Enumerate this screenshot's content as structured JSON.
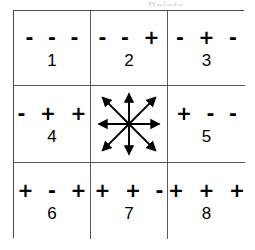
{
  "figure": {
    "type": "grid-diagram",
    "top_caption_remnant": "Points",
    "rows": 3,
    "cols": 3,
    "line_color": "#4a4a4a",
    "background": "#ffffff",
    "ink_color": "#000000"
  },
  "cells": [
    {
      "position": "top-left",
      "signs": "- - -",
      "number": "1",
      "kind": "labeled"
    },
    {
      "position": "top-center",
      "signs": "- - +",
      "number": "2",
      "kind": "labeled"
    },
    {
      "position": "top-right",
      "signs": "- + -",
      "number": "3",
      "kind": "labeled"
    },
    {
      "position": "middle-left",
      "signs": "- + +",
      "number": "4",
      "kind": "labeled"
    },
    {
      "position": "middle-center",
      "signs": "",
      "number": "",
      "kind": "arrows"
    },
    {
      "position": "middle-right",
      "signs": "+ - -",
      "number": "5",
      "kind": "labeled"
    },
    {
      "position": "bottom-left",
      "signs": "+ - +",
      "number": "6",
      "kind": "labeled"
    },
    {
      "position": "bottom-center",
      "signs": "+ + -",
      "number": "7",
      "kind": "labeled"
    },
    {
      "position": "bottom-right",
      "signs": "+ + +",
      "number": "8",
      "kind": "labeled"
    }
  ],
  "center": {
    "description": "eight arrows radiating from center to all eight neighbouring cells",
    "arrow_count": 8,
    "directions": [
      "north",
      "north-east",
      "east",
      "south-east",
      "south",
      "south-west",
      "west",
      "north-west"
    ],
    "arrow_color": "#000000"
  }
}
